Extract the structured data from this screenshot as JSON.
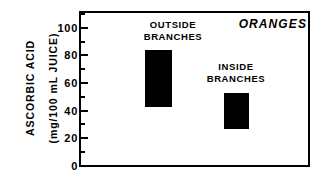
{
  "chart_data": {
    "type": "bar",
    "bar_style": "floating-range",
    "title": "ORANGES",
    "xlabel": "",
    "ylabel": "ASCORBIC ACID (mg/100 mL JUICE)",
    "ylabel_lines": [
      "ASCORBIC ACID",
      "(mg/100 mL JUICE)"
    ],
    "ylim": [
      0,
      112
    ],
    "grid": false,
    "legend": "none",
    "categories": [
      "OUTSIDE BRANCHES",
      "INSIDE BRANCHES"
    ],
    "series": [
      {
        "name": "Ascorbic acid range",
        "ranges": [
          {
            "category": "OUTSIDE BRANCHES",
            "low": 43,
            "high": 84
          },
          {
            "category": "INSIDE BRANCHES",
            "low": 27,
            "high": 53
          }
        ]
      }
    ],
    "values_low": [
      43,
      27
    ],
    "values_high": [
      84,
      53
    ],
    "y_ticks_major": [
      0,
      20,
      40,
      60,
      80,
      100
    ],
    "y_tick_labels": [
      "0",
      "20",
      "40",
      "60",
      "80",
      "100"
    ],
    "y_ticks_minor": [
      10,
      30,
      50,
      70,
      90,
      110
    ],
    "annotations": [
      {
        "text": "OUTSIDE BRANCHES",
        "lines": [
          "OUTSIDE",
          "BRANCHES"
        ]
      },
      {
        "text": "INSIDE BRANCHES",
        "lines": [
          "INSIDE",
          "BRANCHES"
        ]
      }
    ],
    "colors": {
      "bar": "#000000",
      "axis": "#000000",
      "background": "#ffffff",
      "text": "#000000"
    }
  },
  "axis": {
    "tick_0": "0",
    "tick_20": "20",
    "tick_40": "40",
    "tick_60": "60",
    "tick_80": "80",
    "tick_100": "100"
  },
  "labels": {
    "ylabel_line1": "ASCORBIC ACID",
    "ylabel_line2": "(mg/100 mL JUICE)",
    "outside_line1": "OUTSIDE",
    "outside_line2": "BRANCHES",
    "inside_line1": "INSIDE",
    "inside_line2": "BRANCHES",
    "title": "ORANGES"
  }
}
